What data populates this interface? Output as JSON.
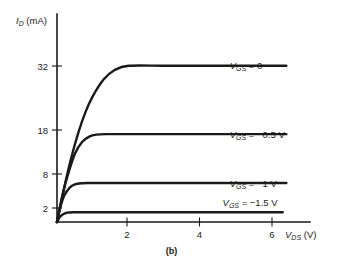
{
  "figure": {
    "caption": "(b)"
  },
  "chart_data": {
    "type": "line",
    "title": "",
    "subtitle": "",
    "xlabel_symbol": "V",
    "xlabel_sub": "DS",
    "xlabel_unit": "(V)",
    "xlabel": "V_DS (V)",
    "ylabel_symbol": "I",
    "ylabel_sub": "D",
    "ylabel_unit": "(mA)",
    "ylabel": "I_D (mA)",
    "xlim": [
      0,
      6.4
    ],
    "ylim": [
      0,
      40
    ],
    "xticks": [
      2,
      4,
      6
    ],
    "xtick_labels": [
      "2",
      "4",
      "6"
    ],
    "yticks": [
      2,
      8,
      18,
      32
    ],
    "ytick_labels": [
      "2",
      "8",
      "18",
      "32"
    ],
    "grid": false,
    "legend_position": "right-inline",
    "series": [
      {
        "name": "V_GS = 0",
        "label_symbol": "V",
        "label_sub": "GS",
        "label_value": "= 0",
        "saturation_current_mA": 32,
        "knee_voltage_V": 2.0,
        "label_x_V": 6.55,
        "x": [
          0,
          0.2,
          0.4,
          0.6,
          0.8,
          1.0,
          1.3,
          1.6,
          2.0,
          3.0,
          4.0,
          5.0,
          6.0,
          6.4
        ],
        "y": [
          0,
          7.0,
          13.2,
          18.4,
          22.6,
          25.8,
          29.2,
          31.1,
          32.0,
          32.0,
          32.0,
          32.0,
          32.0,
          32.0
        ]
      },
      {
        "name": "V_GS = -0.5 V",
        "label_symbol": "V",
        "label_sub": "GS",
        "label_value": "= −0.5 V",
        "saturation_current_mA": 18,
        "knee_voltage_V": 1.4,
        "label_x_V": 6.55,
        "x": [
          0,
          0.15,
          0.3,
          0.5,
          0.7,
          0.9,
          1.1,
          1.4,
          2.0,
          3.0,
          4.0,
          5.0,
          6.0,
          6.4
        ],
        "y": [
          0,
          5.4,
          9.6,
          14.0,
          16.4,
          17.5,
          17.9,
          18.0,
          18.0,
          18.0,
          18.0,
          18.0,
          18.0,
          18.0
        ]
      },
      {
        "name": "V_GS = -1 V",
        "label_symbol": "V",
        "label_sub": "GS",
        "label_value": "= −1 V",
        "saturation_current_mA": 8,
        "knee_voltage_V": 0.9,
        "label_x_V": 6.55,
        "x": [
          0,
          0.1,
          0.2,
          0.35,
          0.5,
          0.7,
          0.9,
          1.5,
          2.5,
          4.0,
          5.5,
          6.4
        ],
        "y": [
          0,
          3.2,
          5.4,
          7.0,
          7.7,
          7.95,
          8.0,
          8.0,
          8.0,
          8.0,
          8.0,
          8.0
        ]
      },
      {
        "name": "V_GS = -1.5 V",
        "label_symbol": "V",
        "label_sub": "GS",
        "label_value": "= −1.5 V",
        "saturation_current_mA": 2,
        "knee_voltage_V": 0.45,
        "label_x_V": 6.35,
        "x": [
          0,
          0.08,
          0.16,
          0.28,
          0.45,
          1.0,
          2.0,
          3.5,
          5.0,
          6.0,
          6.3
        ],
        "y": [
          0,
          1.0,
          1.55,
          1.9,
          2.0,
          2.0,
          2.0,
          2.0,
          2.0,
          2.0,
          2.0
        ]
      }
    ]
  }
}
